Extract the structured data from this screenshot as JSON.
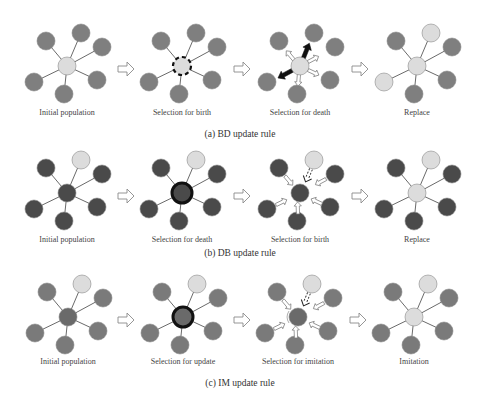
{
  "figure": {
    "colors": {
      "mid_gray": "#7f7f7f",
      "dark_gray": "#4a4a4a",
      "light_gray": "#dcdcdc",
      "highlight_ring": "#111111",
      "edge": "#6a6a6a"
    },
    "rows": [
      {
        "id": "bd",
        "caption": "(a)  BD update rule",
        "panels": [
          {
            "label": "Initial  population"
          },
          {
            "label": "Selection for birth"
          },
          {
            "label": "Selection for death"
          },
          {
            "label": "Replace"
          }
        ]
      },
      {
        "id": "db",
        "caption": "(b)  DB update rule",
        "panels": [
          {
            "label": "Initial population"
          },
          {
            "label": "Selection for death"
          },
          {
            "label": "Selection for birth"
          },
          {
            "label": "Replace"
          }
        ]
      },
      {
        "id": "im",
        "caption": "(c)  IM update rule",
        "panels": [
          {
            "label": "Initial population"
          },
          {
            "label": "Selection for update"
          },
          {
            "label": "Selection for imitation"
          },
          {
            "label": "Imitation"
          }
        ]
      }
    ]
  }
}
